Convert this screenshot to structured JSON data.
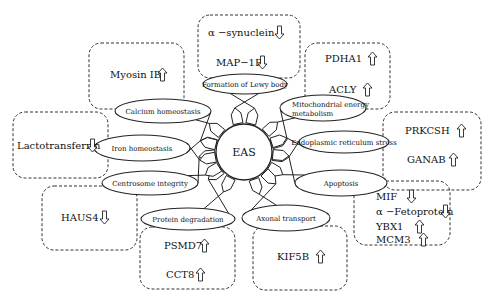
{
  "diagram": {
    "hub": {
      "label": "EAS",
      "cx": 244,
      "cy": 152,
      "r": 28
    },
    "arrow_colors": {
      "stroke": "#222222",
      "fill": "#ffffff"
    },
    "processes": [
      {
        "id": "formation-lewy-body",
        "label": "Formation of Lewy body",
        "cx": 245,
        "cy": 84,
        "rx": 42,
        "ry": 10
      },
      {
        "id": "mitochondrial-energy-metabolism",
        "label": "Mitochondrial energy",
        "label2": "metabolism",
        "cx": 323,
        "cy": 108,
        "rx": 43,
        "ry": 13
      },
      {
        "id": "er-stress",
        "label": "Endoplasmic reticulum stress",
        "cx": 344,
        "cy": 142,
        "rx": 45,
        "ry": 11
      },
      {
        "id": "apoptosis",
        "label": "Apoptosis",
        "cx": 341,
        "cy": 183,
        "rx": 46,
        "ry": 13
      },
      {
        "id": "axonal-transport",
        "label": "Axonal transport",
        "cx": 286,
        "cy": 218,
        "rx": 44,
        "ry": 13
      },
      {
        "id": "protein-degradation",
        "label": "Protein degradation",
        "cx": 188,
        "cy": 219,
        "rx": 47,
        "ry": 11
      },
      {
        "id": "centrosome-integrity",
        "label": "Centrosome integrity",
        "cx": 150,
        "cy": 183,
        "rx": 48,
        "ry": 12
      },
      {
        "id": "iron-homeostasis",
        "label": "Iron homeostasis",
        "cx": 142,
        "cy": 148,
        "rx": 48,
        "ry": 13
      },
      {
        "id": "calcium-homeostasis",
        "label": "Calcium homeostasis",
        "cx": 163,
        "cy": 111,
        "rx": 48,
        "ry": 12
      }
    ],
    "boxes": [
      {
        "id": "box-lewy",
        "x": 198,
        "y": 15,
        "w": 102,
        "h": 63,
        "items": [
          {
            "label": "α −synuclein",
            "direction": "down",
            "x": 208,
            "y": 36,
            "ax": 275
          },
          {
            "label": "MAP−1B",
            "direction": "down",
            "x": 216,
            "y": 66,
            "ax": 258
          }
        ]
      },
      {
        "id": "box-mito",
        "x": 305,
        "y": 43,
        "w": 85,
        "h": 66,
        "items": [
          {
            "label": "PDHA1",
            "direction": "up",
            "x": 325,
            "y": 62,
            "ax": 368
          },
          {
            "label": "ACLY",
            "direction": "up",
            "x": 329,
            "y": 93,
            "ax": 363
          }
        ]
      },
      {
        "id": "box-er",
        "x": 383,
        "y": 112,
        "w": 98,
        "h": 78,
        "items": [
          {
            "label": "PRKCSH",
            "direction": "up",
            "x": 405,
            "y": 134,
            "ax": 457
          },
          {
            "label": "GANAB",
            "direction": "up",
            "x": 407,
            "y": 163,
            "ax": 449
          }
        ]
      },
      {
        "id": "box-apoptosis",
        "x": 354,
        "y": 181,
        "w": 96,
        "h": 64,
        "items": [
          {
            "label": "MIF",
            "direction": "down",
            "x": 376,
            "y": 200,
            "ax": 407
          },
          {
            "label": "α −Fetoprotein",
            "direction": "down",
            "x": 376,
            "y": 215,
            "ax": 441
          },
          {
            "label": "YBX1",
            "direction": "up",
            "x": 376,
            "y": 230,
            "ax": 415
          },
          {
            "label": "MCM3",
            "direction": "up",
            "x": 376,
            "y": 243,
            "ax": 419
          }
        ]
      },
      {
        "id": "box-axonal",
        "x": 253,
        "y": 226,
        "w": 94,
        "h": 64,
        "items": [
          {
            "label": "KIF5B",
            "direction": "up",
            "x": 277,
            "y": 260,
            "ax": 316
          }
        ]
      },
      {
        "id": "box-protein",
        "x": 140,
        "y": 227,
        "w": 95,
        "h": 62,
        "items": [
          {
            "label": "PSMD7",
            "direction": "up",
            "x": 164,
            "y": 249,
            "ax": 200
          },
          {
            "label": "CCT8",
            "direction": "up",
            "x": 166,
            "y": 278,
            "ax": 196
          }
        ]
      },
      {
        "id": "box-centrosome",
        "x": 42,
        "y": 186,
        "w": 95,
        "h": 64,
        "items": [
          {
            "label": "HAUS4",
            "direction": "down",
            "x": 61,
            "y": 221,
            "ax": 100
          }
        ]
      },
      {
        "id": "box-iron",
        "x": 13,
        "y": 112,
        "w": 95,
        "h": 66,
        "items": [
          {
            "label": "Lactotransferrin",
            "direction": "down",
            "x": 17,
            "y": 149,
            "ax": 88
          }
        ]
      },
      {
        "id": "box-calcium",
        "x": 89,
        "y": 43,
        "w": 95,
        "h": 66,
        "items": [
          {
            "label": "Myosin IB",
            "direction": "up",
            "x": 110,
            "y": 78,
            "ax": 158
          }
        ]
      }
    ]
  }
}
